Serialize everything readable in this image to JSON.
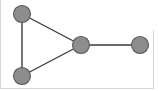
{
  "figure": {
    "background_color": "#ffffff",
    "width": 158,
    "height": 91,
    "border_color": "#d8d8d8"
  },
  "style": {
    "node_fill": "#8d8d8d",
    "node_stroke": "#5a5a5a",
    "node_stroke_width": 1.1,
    "node_radius": 8.5,
    "edge_color": "#3b3b3b",
    "edge_width": 1.4
  },
  "chart_data": {
    "type": "diagram",
    "title": "",
    "diagram_kind": "undirected-graph",
    "node_count": 4,
    "edge_count": 4,
    "nodes": [
      {
        "id": "n1",
        "label": "",
        "x": 22,
        "y": 14,
        "r": 8.5,
        "degree": 2
      },
      {
        "id": "n2",
        "label": "",
        "x": 22,
        "y": 76,
        "r": 8.5,
        "degree": 2
      },
      {
        "id": "n3",
        "label": "",
        "x": 81,
        "y": 45,
        "r": 8.5,
        "degree": 3
      },
      {
        "id": "n4",
        "label": "",
        "x": 140,
        "y": 45,
        "r": 8.5,
        "degree": 1
      }
    ],
    "edges": [
      {
        "id": "e1",
        "source": "n1",
        "target": "n2"
      },
      {
        "id": "e2",
        "source": "n1",
        "target": "n3"
      },
      {
        "id": "e3",
        "source": "n2",
        "target": "n3"
      },
      {
        "id": "e4",
        "source": "n3",
        "target": "n4"
      }
    ],
    "legend": [],
    "annotations": []
  }
}
